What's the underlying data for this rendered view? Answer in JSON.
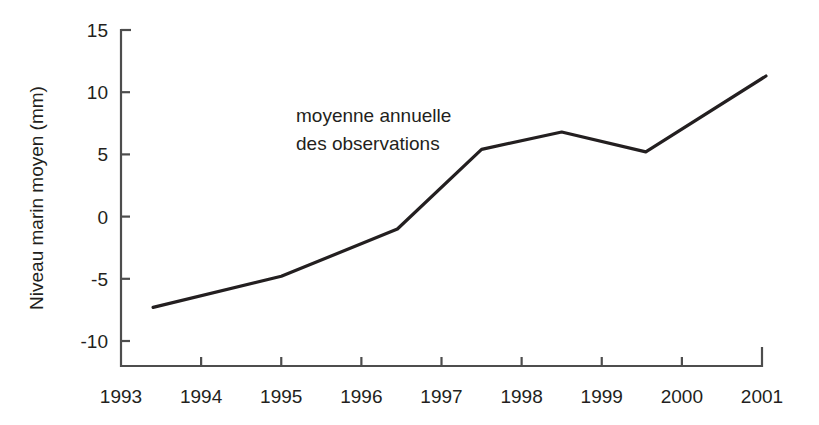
{
  "figure": {
    "background_color": "#ffffff",
    "line_color": "#231f20",
    "axis_color": "#4d4d4d",
    "text_color": "#231f20"
  },
  "annotation": {
    "line1": "moyenne annuelle",
    "line2": "des observations"
  },
  "axis": {
    "y_title": "Niveau marin moyen (mm)",
    "x_title": "",
    "y_ticks": [
      "15",
      "10",
      "5",
      "0",
      "-5",
      "-10"
    ],
    "x_ticks": [
      "1993",
      "1994",
      "1995",
      "1996",
      "1997",
      "1998",
      "1999",
      "2000",
      "2001"
    ]
  },
  "chart_data": {
    "type": "line",
    "title": "",
    "subtitle": "",
    "xlabel": "",
    "ylabel": "Niveau marin moyen (mm)",
    "xlim": [
      1993,
      2001
    ],
    "ylim": [
      -10,
      15
    ],
    "y_ticks": [
      15,
      10,
      5,
      0,
      -5,
      10
    ],
    "y_tick_labels": [
      "15",
      "10",
      "5",
      "0",
      "-5",
      "-10"
    ],
    "x_ticks": [
      1993,
      1994,
      1995,
      1996,
      1997,
      1998,
      1999,
      2000,
      2001
    ],
    "x_tick_labels": [
      "1993",
      "1994",
      "1995",
      "1996",
      "1997",
      "1998",
      "1999",
      "2000",
      "2001"
    ],
    "grid": false,
    "legend": null,
    "annotations": [
      {
        "text": "moyenne annuelle des observations",
        "x": 1996.0,
        "y": 10.0
      }
    ],
    "series": [
      {
        "name": "moyenne annuelle des observations",
        "color": "#231f20",
        "x": [
          1993.4,
          1995.0,
          1996.45,
          1997.5,
          1998.5,
          1999.55,
          2001.05
        ],
        "y": [
          -7.3,
          -4.8,
          -1.0,
          5.4,
          6.8,
          5.2,
          11.3
        ],
        "points": [
          {
            "x": 1993.4,
            "y": -7.3
          },
          {
            "x": 1995.0,
            "y": -4.8
          },
          {
            "x": 1996.45,
            "y": -1.0
          },
          {
            "x": 1997.5,
            "y": 5.4
          },
          {
            "x": 1998.5,
            "y": 6.8
          },
          {
            "x": 1999.55,
            "y": 5.2
          },
          {
            "x": 2001.05,
            "y": 11.3
          }
        ]
      }
    ]
  }
}
